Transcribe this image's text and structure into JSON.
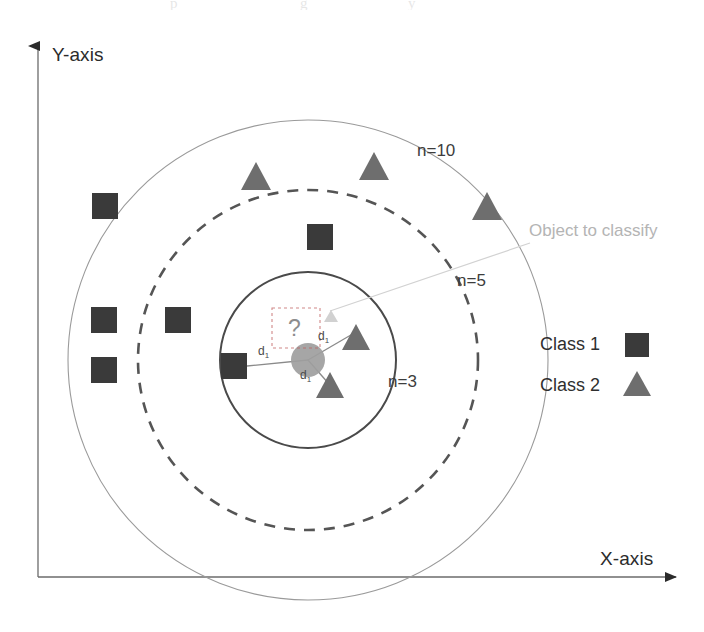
{
  "figure": {
    "type": "diagram",
    "topic": "k-nearest-neighbours classification",
    "background": "#ffffff"
  },
  "axes": {
    "y_label": "Y-axis",
    "x_label": "X-axis",
    "axis_color": "#555555"
  },
  "rings": [
    {
      "id": "inner",
      "label": "n=3",
      "n": 3,
      "radius": 88,
      "style": "solid",
      "stroke": "#4a4a4a",
      "width": 2.0,
      "label_x": 388,
      "label_y": 381
    },
    {
      "id": "middle",
      "label": "n=5",
      "n": 5,
      "radius": 170,
      "style": "dashed",
      "stroke": "#555555",
      "width": 2.6,
      "label_x": 457,
      "label_y": 280
    },
    {
      "id": "outer",
      "label": "n=10",
      "n": 10,
      "radius": 240,
      "style": "solid",
      "stroke": "#9a9a9a",
      "width": 1.1,
      "label_x": 417,
      "label_y": 150
    }
  ],
  "center": {
    "x": 308,
    "y": 360,
    "radius": 17,
    "fill": "#9e9e9e"
  },
  "query": {
    "box_label": "?",
    "annotation": "Object to classify",
    "annotation_color": "#b4b4b4",
    "box": {
      "x": 272,
      "y": 308,
      "w": 48,
      "h": 40
    }
  },
  "legend": {
    "items": [
      {
        "label": "Class 1",
        "marker": "square",
        "color": "#3a3a3a"
      },
      {
        "label": "Class 2",
        "marker": "triangle",
        "color": "#6e6e6e"
      }
    ]
  },
  "markers": {
    "class1_color": "#3a3a3a",
    "class2_color": "#6e6e6e",
    "squares": [
      {
        "x": 105,
        "y": 206,
        "size": 26
      },
      {
        "x": 104,
        "y": 320,
        "size": 26
      },
      {
        "x": 104,
        "y": 370,
        "size": 26
      },
      {
        "x": 178,
        "y": 320,
        "size": 26
      },
      {
        "x": 320,
        "y": 237,
        "size": 26
      },
      {
        "x": 234,
        "y": 366,
        "size": 26
      }
    ],
    "triangles": [
      {
        "x": 256,
        "y": 176,
        "size": 28
      },
      {
        "x": 374,
        "y": 166,
        "size": 28
      },
      {
        "x": 487,
        "y": 206,
        "size": 28
      },
      {
        "x": 352,
        "y": 337,
        "size": 26
      },
      {
        "x": 326,
        "y": 385,
        "size": 26
      }
    ]
  },
  "distances": [
    {
      "label": "d",
      "sub": "1",
      "x": 264,
      "y": 352,
      "from": [
        234,
        366
      ],
      "to": [
        308,
        360
      ]
    },
    {
      "label": "d",
      "sub": "1",
      "x": 323,
      "y": 338,
      "from": [
        308,
        360
      ],
      "to": [
        352,
        337
      ]
    },
    {
      "label": "d",
      "sub": "1",
      "x": 306,
      "y": 375,
      "from": [
        308,
        360
      ],
      "to": [
        326,
        385
      ]
    }
  ],
  "leader_line": {
    "from": [
      530,
      240
    ],
    "to": [
      330,
      312
    ]
  }
}
